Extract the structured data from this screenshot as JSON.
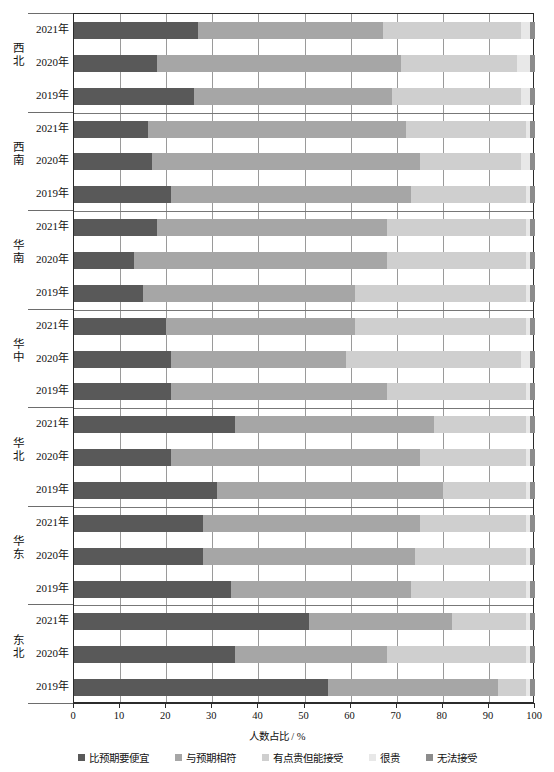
{
  "chart_data": {
    "type": "bar",
    "subtype": "horizontal-stacked-100-percent",
    "title": "",
    "xlabel": "人数占比 / %",
    "ylabel": "",
    "xlim": [
      0,
      100
    ],
    "xticks": [
      0,
      10,
      20,
      30,
      40,
      50,
      60,
      70,
      80,
      90,
      100
    ],
    "grid": true,
    "grid_axis": "x",
    "legend_position": "bottom",
    "series": [
      {
        "name": "比预期要便宜",
        "color": "#595959"
      },
      {
        "name": "与预期相符",
        "color": "#a6a6a6"
      },
      {
        "name": "有点贵但能接受",
        "color": "#cfcfcf"
      },
      {
        "name": "很贵",
        "color": "#e8e8e8"
      },
      {
        "name": "无法接受",
        "color": "#8c8c8c"
      }
    ],
    "groups": [
      {
        "region": "西北",
        "categories": [
          "2021年",
          "2020年",
          "2019年"
        ],
        "rows": [
          {
            "category": "2021年",
            "values": [
              27,
              40,
              30,
              2,
              1
            ]
          },
          {
            "category": "2020年",
            "values": [
              18,
              53,
              25,
              3,
              1
            ]
          },
          {
            "category": "2019年",
            "values": [
              26,
              43,
              28,
              2,
              1
            ]
          }
        ]
      },
      {
        "region": "西南",
        "categories": [
          "2021年",
          "2020年",
          "2019年"
        ],
        "rows": [
          {
            "category": "2021年",
            "values": [
              16,
              56,
              26,
              1,
              1
            ]
          },
          {
            "category": "2020年",
            "values": [
              17,
              58,
              22,
              2,
              1
            ]
          },
          {
            "category": "2019年",
            "values": [
              21,
              52,
              25,
              1,
              1
            ]
          }
        ]
      },
      {
        "region": "华南",
        "categories": [
          "2021年",
          "2020年",
          "2019年"
        ],
        "rows": [
          {
            "category": "2021年",
            "values": [
              18,
              50,
              30,
              1,
              1
            ]
          },
          {
            "category": "2020年",
            "values": [
              13,
              55,
              30,
              1,
              1
            ]
          },
          {
            "category": "2019年",
            "values": [
              15,
              46,
              37,
              1,
              1
            ]
          }
        ]
      },
      {
        "region": "华中",
        "categories": [
          "2021年",
          "2020年",
          "2019年"
        ],
        "rows": [
          {
            "category": "2021年",
            "values": [
              20,
              41,
              37,
              1,
              1
            ]
          },
          {
            "category": "2020年",
            "values": [
              21,
              38,
              38,
              2,
              1
            ]
          },
          {
            "category": "2019年",
            "values": [
              21,
              47,
              30,
              1,
              1
            ]
          }
        ]
      },
      {
        "region": "华北",
        "categories": [
          "2021年",
          "2020年",
          "2019年"
        ],
        "rows": [
          {
            "category": "2021年",
            "values": [
              35,
              43,
              20,
              1,
              1
            ]
          },
          {
            "category": "2020年",
            "values": [
              21,
              54,
              23,
              1,
              1
            ]
          },
          {
            "category": "2019年",
            "values": [
              31,
              49,
              18,
              1,
              1
            ]
          }
        ]
      },
      {
        "region": "华东",
        "categories": [
          "2021年",
          "2020年",
          "2019年"
        ],
        "rows": [
          {
            "category": "2021年",
            "values": [
              28,
              47,
              23,
              1,
              1
            ]
          },
          {
            "category": "2020年",
            "values": [
              28,
              46,
              24,
              1,
              1
            ]
          },
          {
            "category": "2019年",
            "values": [
              34,
              39,
              25,
              1,
              1
            ]
          }
        ]
      },
      {
        "region": "东北",
        "categories": [
          "2021年",
          "2020年",
          "2019年"
        ],
        "rows": [
          {
            "category": "2021年",
            "values": [
              51,
              31,
              16,
              1,
              1
            ]
          },
          {
            "category": "2020年",
            "values": [
              35,
              33,
              30,
              1,
              1
            ]
          },
          {
            "category": "2019年",
            "values": [
              55,
              37,
              6,
              1,
              1
            ]
          }
        ]
      }
    ]
  },
  "axis": {
    "x_title": "人数占比 / %",
    "x_tick_labels": [
      "0",
      "10",
      "20",
      "30",
      "40",
      "50",
      "60",
      "70",
      "80",
      "90",
      "100"
    ]
  },
  "legend": {
    "items": [
      {
        "label": "比预期要便宜",
        "color": "#595959"
      },
      {
        "label": "与预期相符",
        "color": "#a6a6a6"
      },
      {
        "label": "有点贵但能接受",
        "color": "#cfcfcf"
      },
      {
        "label": "很贵",
        "color": "#e8e8e8"
      },
      {
        "label": "无法接受",
        "color": "#8c8c8c"
      }
    ]
  }
}
